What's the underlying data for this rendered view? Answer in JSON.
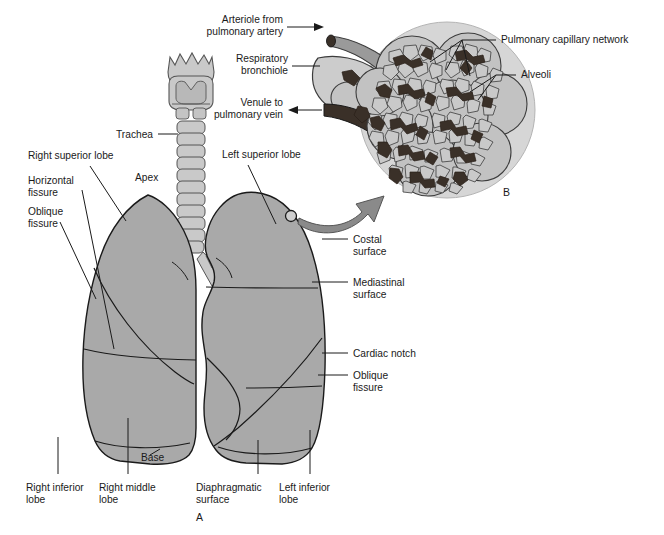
{
  "figure": {
    "panels": [
      {
        "id": "A",
        "letter": "A",
        "caption": "Gross anatomy of the lungs, trachea and bronchi"
      },
      {
        "id": "B",
        "letter": "B",
        "caption": "Magnified alveolar cluster with capillary network"
      }
    ]
  },
  "colors": {
    "lung_fill": "#a9a9a9",
    "lung_stroke": "#1a1a1a",
    "trachea_fill": "#c9c9c9",
    "trachea_stroke": "#555555",
    "inset_circle_fill": "#d6d6d6",
    "alveoli_fill": "#c2c2c2",
    "alveoli_stroke": "#3c3c3c",
    "capillary_fill": "#3a3028",
    "arrow_fill": "#8a8a8a",
    "arteriole_fill": "#9a9a9a",
    "venule_fill": "#3a3028",
    "bronchiole_fill": "#cccccc",
    "leader_line": "#1a1a1a",
    "background": "#ffffff",
    "text": "#1a1a1a"
  },
  "labels": {
    "arteriole": {
      "line1": "Arteriole from",
      "line2": "pulmonary artery",
      "arrow": "right"
    },
    "respiratory_bronchiole": {
      "line1": "Respiratory",
      "line2": "bronchiole",
      "arrow": "none"
    },
    "venule": {
      "line1": "Venule to",
      "line2": "pulmonary vein",
      "arrow": "left"
    },
    "pulmonary_capillary_network": {
      "line1": "Pulmonary capillary network",
      "line2": ""
    },
    "alveoli": {
      "line1": "Alveoli",
      "line2": ""
    },
    "trachea": {
      "line1": "Trachea",
      "line2": ""
    },
    "right_superior_lobe": {
      "line1": "Right superior lobe",
      "line2": ""
    },
    "horizontal_fissure": {
      "line1": "Horizontal",
      "line2": "fissure"
    },
    "oblique_fissure_left_side": {
      "line1": "Oblique",
      "line2": "fissure"
    },
    "apex": {
      "line1": "Apex",
      "line2": ""
    },
    "left_superior_lobe": {
      "line1": "Left superior lobe",
      "line2": ""
    },
    "costal_surface": {
      "line1": "Costal",
      "line2": "surface"
    },
    "mediastinal_surface": {
      "line1": "Mediastinal",
      "line2": "surface"
    },
    "cardiac_notch": {
      "line1": "Cardiac notch",
      "line2": ""
    },
    "oblique_fissure_right_side": {
      "line1": "Oblique",
      "line2": "fissure"
    },
    "right_inferior_lobe": {
      "line1": "Right inferior",
      "line2": "lobe"
    },
    "right_middle_lobe": {
      "line1": "Right middle",
      "line2": "lobe"
    },
    "base": {
      "line1": "Base",
      "line2": ""
    },
    "diaphragmatic_surface": {
      "line1": "Diaphragmatic",
      "line2": "surface"
    },
    "left_inferior_lobe": {
      "line1": "Left inferior",
      "line2": "lobe"
    }
  }
}
